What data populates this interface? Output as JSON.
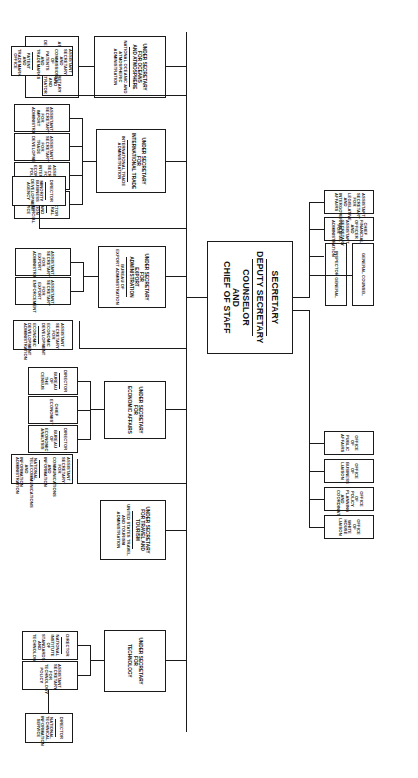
{
  "chart": {
    "type": "org-chart"
  },
  "head": {
    "secretary": "SECRETARY",
    "deputy_secretary": "DEPUTY SECRETARY",
    "counselor_l1": "COUNSELOR",
    "counselor_l2": "AND",
    "counselor_l3": "CHIEF OF STAFF"
  },
  "staff_top": [
    {
      "line1": "GENERAL COUNSEL"
    },
    {
      "line1": "INSPECTOR GENERAL"
    },
    {
      "line1": "CHIEF FINANCIAL OFFICER AND",
      "line2": "ASSISTANT SECRETARY FOR",
      "line3": "ADMINISTRATION"
    },
    {
      "line1": "ASSISTANT SECRETARY FOR",
      "line2": "LEGISLATIVE AND",
      "line3": "INTERGOVERNMENTAL AFFAIRS"
    }
  ],
  "staff_bottom": [
    {
      "line1": "OFFICE OF PUBLIC AFFAIRS"
    },
    {
      "line1": "OFFICE OF BUSINESS LIAISON"
    },
    {
      "line1": "OFFICE OF POLICY",
      "line2": "PLANNING AND COORDINATION"
    },
    {
      "line1": "OFFICE OF",
      "line2": "WHITE HOUSE LIAISON"
    }
  ],
  "branches": {
    "technology": {
      "head": {
        "line1": "UNDER SECRETARY",
        "line2": "FOR",
        "line3": "TECHNOLOGY"
      },
      "children": [
        {
          "top": "DIRECTOR",
          "sub1": "NATIONAL INSTITUTE OF",
          "sub2": "STANDARDS AND",
          "sub3": "TECHNOLOGY"
        },
        {
          "line1": "ASSISTANT SECRETARY",
          "line2": "FOR",
          "line3": "TECHNOLOGY POLICY"
        }
      ],
      "grandchild": {
        "top": "DIRECTOR",
        "sub1": "NATIONAL TECHNICAL",
        "sub2": "INFORMATION SERVICE"
      }
    },
    "travel": {
      "head": {
        "line1": "UNDER SECRETARY",
        "line2": "FOR TRAVEL AND TOURISM",
        "sub1": "UNITED STATES TRAVEL",
        "sub2": "AND TOURISM ADMINISTRATION"
      }
    },
    "economic_affairs": {
      "head": {
        "line1": "UNDER SECRETARY",
        "line2": "FOR",
        "line3": "ECONOMIC AFFAIRS"
      },
      "children": [
        {
          "top": "DIRECTOR",
          "sub1": "BUREAU OF",
          "sub2": "THE CENSUS"
        },
        {
          "line1": "CHIEF ECONOMIST"
        },
        {
          "top": "DIRECTOR",
          "sub1": "BUREAU OF",
          "sub2": "ECONOMIC ANALYSIS"
        }
      ]
    },
    "export_administration": {
      "head": {
        "line1": "UNDER SECRETARY FOR",
        "line2": "EXPORT ADMINISTRATION",
        "sub1": "BUREAU OF",
        "sub2": "EXPORT ADMINISTRATION"
      },
      "children": [
        {
          "line1": "ASSISTANT SECRETARY",
          "line2": "FOR EXPORT",
          "line3": "ENFORCEMENT"
        },
        {
          "line1": "ASSISTANT SECRETARY",
          "line2": "FOR",
          "line3": "EXPORT ADMINISTRATION"
        }
      ]
    },
    "international_trade": {
      "head": {
        "line1": "UNDER SECRETARY FOR",
        "line2": "INTERNATIONAL TRADE",
        "sub1": "INTERNATIONAL TRADE",
        "sub2": "ADMINISTRATION"
      },
      "children": [
        {
          "line1": "ASSISTANT SECRETARY",
          "line2": "FOR",
          "line3": "IMPORT ADMINISTRATION"
        },
        {
          "line1": "ASSISTANT SECRETARY",
          "line2": "FOR",
          "line3": "TRADE DEVELOPMENT"
        },
        {
          "line1": "ASSISTANT SECRETARY",
          "line2": "FOR INTERNATIONAL",
          "line3": "ECONOMIC POLICY"
        },
        {
          "top": "DIRECTOR GENERAL",
          "sub1": "U.S. AND FOREIGN",
          "sub2": "COMMERCIAL SERVICE"
        }
      ]
    },
    "oceans": {
      "head": {
        "line1": "UNDER SECRETARY",
        "line2": "FOR OCEANS",
        "line3": "AND ATMOSPHERE",
        "sub1": "NATIONAL OCEANIC AND",
        "sub2": "ATMOSPHERIC ADMINISTRATION"
      },
      "children": [
        {
          "line1": "ASSISTANT SECRETARY",
          "line2": "FOR OCEANS AND",
          "line3": "ATMOSPHERE AND",
          "line4": "DEPUTY ADMINISTRATOR"
        }
      ]
    },
    "standalone": [
      {
        "line1": "ASSISTANT SECRETARY",
        "line2": "FOR COMMUNICATIONS",
        "line3": "AND INFORMATION",
        "sub1": "NATIONAL TELECOMMUNICATIONS",
        "sub2": "AND INFORMATION ADMINISTRATION"
      },
      {
        "line1": "ASSISTANT SECRETARY",
        "line2": "FOR",
        "line3": "ECONOMIC DEVELOPMENT",
        "sub1": "ECONOMIC DEVELOPMENT",
        "sub2": "ADMINISTRATION"
      },
      {
        "top": "DIRECTOR",
        "sub1": "MINORITY BUSINESS",
        "sub2": "DEVELOPMENT AGENCY"
      },
      {
        "line1": "ASSISTANT SECRETARY AND",
        "line2": "COMMISSIONER OF PATENTS",
        "line3": "AND TRADEMARKS",
        "sub1": "PATENT AND",
        "sub2": "TRADEMARK",
        "sub3": "OFFICE"
      }
    ]
  },
  "colors": {
    "line": "#1a1a1a",
    "box_bg": "#ffffff",
    "page_bg": "#ffffff"
  }
}
